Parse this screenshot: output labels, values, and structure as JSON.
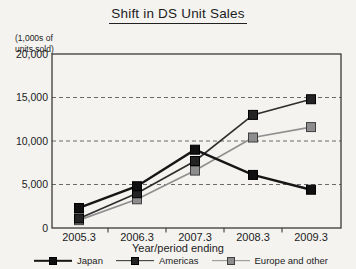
{
  "chart_data": {
    "type": "line",
    "title": "Shift in DS Unit Sales",
    "unit_label_lines": [
      "(1,000s of",
      "units sold)"
    ],
    "xlabel": "Year/period ending",
    "categories": [
      "2005.3",
      "2006.3",
      "2007.3",
      "2008.3",
      "2009.3"
    ],
    "yticks": [
      0,
      5000,
      10000,
      15000,
      20000
    ],
    "ytick_labels": [
      "0",
      "5,000",
      "10,000",
      "15,000",
      "20,000"
    ],
    "ylim": [
      0,
      20000
    ],
    "grid": "horizontal dashed lines at 5000, 10000, 15000",
    "legend_position": "bottom",
    "series": [
      {
        "name": "Japan",
        "values": [
          2300,
          4800,
          9000,
          6100,
          4400
        ],
        "line_color": "#161616",
        "line_width": 2.4,
        "marker_color": "#101010",
        "marker_edge": "#000000"
      },
      {
        "name": "Americas",
        "values": [
          1100,
          4000,
          7700,
          13000,
          14800
        ],
        "line_color": "#2e2e2e",
        "line_width": 1.7,
        "marker_color": "#232323",
        "marker_edge": "#000000"
      },
      {
        "name": "Europe and other",
        "values": [
          900,
          3300,
          6600,
          10400,
          11600
        ],
        "line_color": "#8f8f8f",
        "line_width": 1.7,
        "marker_color": "#8d8d8d",
        "marker_edge": "#3f3f3f"
      }
    ]
  },
  "colors": {
    "background": "#f4f3f0",
    "axis": "#2b2b2b",
    "grid": "#6b6b6b",
    "text": "#1c1c1c"
  }
}
